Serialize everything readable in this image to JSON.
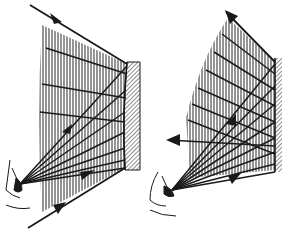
{
  "diagram": {
    "title": "",
    "colors": {
      "ink": "#1a1a1a",
      "hatch": "#2a2a2a",
      "background": "#ffffff"
    },
    "panels": [
      {
        "id": "left",
        "mirror": {
          "x1": 127,
          "y1": 62,
          "x2": 125,
          "y2": 170,
          "width": 14
        },
        "eye": {
          "x": 17,
          "y": 185
        },
        "incoming_ray_top": {
          "x1": 30,
          "y1": 5,
          "x2": 127,
          "y2": 64
        },
        "incoming_ray_bottom": {
          "x1": 28,
          "y1": 228,
          "x2": 125,
          "y2": 168
        },
        "hatch_region": [
          [
            40,
            24
          ],
          [
            127,
            64
          ],
          [
            125,
            168
          ],
          [
            40,
            210
          ]
        ],
        "arrows": [
          {
            "x": 58,
            "y": 16,
            "dir": "down-right"
          },
          {
            "x": 66,
            "y": 128,
            "dir": "up-right"
          },
          {
            "x": 88,
            "y": 176,
            "dir": "right"
          },
          {
            "x": 60,
            "y": 210,
            "dir": "up-right"
          }
        ]
      },
      {
        "id": "right",
        "mirror": {
          "x1": 276,
          "y1": 58,
          "x2": 276,
          "y2": 172,
          "width": 7
        },
        "eye": {
          "x": 170,
          "y": 190
        },
        "incoming_ray_top": {
          "x1": 227,
          "y1": 12,
          "x2": 275,
          "y2": 62
        },
        "hatch_region": [
          [
            230,
            20
          ],
          [
            275,
            62
          ],
          [
            275,
            168
          ],
          [
            185,
            175
          ],
          [
            185,
            115
          ]
        ],
        "arrows": [
          {
            "x": 232,
            "y": 18,
            "dir": "up-left"
          },
          {
            "x": 232,
            "y": 120,
            "dir": "up-right"
          },
          {
            "x": 172,
            "y": 140,
            "dir": "left"
          },
          {
            "x": 235,
            "y": 175,
            "dir": "right"
          }
        ]
      }
    ]
  }
}
